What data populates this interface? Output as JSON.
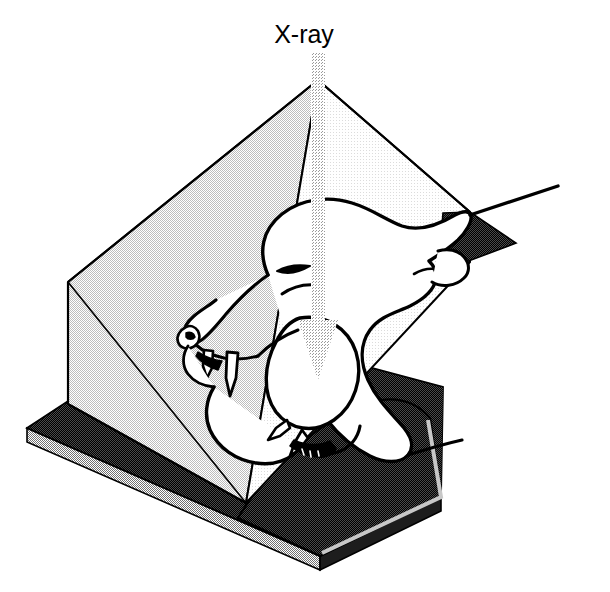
{
  "figure": {
    "domain_type": "diagram",
    "background_color": "#ffffff",
    "width": 610,
    "height": 592
  },
  "annotations": {
    "beam_label": "X-ray"
  },
  "beam": {
    "name": "x-ray-beam",
    "direction": "downward",
    "color": "#b9b9b9",
    "shaft_x": 318,
    "shaft_top_y": 52,
    "shaft_bottom_y": 325,
    "shaft_width": 14,
    "arrowhead_width": 40,
    "arrowhead_tip_y": 380
  },
  "tent": {
    "name": "triangular-prism-chamber",
    "apex": [
      318,
      80
    ],
    "left_corner": [
      68,
      282
    ],
    "front_bottom": [
      246,
      503
    ],
    "right_edge": [
      470,
      212
    ],
    "face_left_color": "#e3e3e3",
    "face_right_color": "#f4f4f4",
    "shadow_triangle_color": "#2a2a2a",
    "outline_color": "#000000"
  },
  "base": {
    "name": "specimen-base-plate",
    "top_color": "#303030",
    "edge_color": "#9a9a9a",
    "side_color": "#1a1a1a",
    "left_corner": [
      27,
      428
    ],
    "front_corner": [
      320,
      556
    ],
    "thickness": 14
  },
  "specimen": {
    "name": "animal-skull-head",
    "description": "line drawing of carnivore head with open jaws and canine teeth",
    "stroke_color": "#000000",
    "fill_color": "#ffffff",
    "body_shadow_color": "#2a2a2a",
    "parts": [
      "cranium",
      "brow",
      "eye",
      "muzzle",
      "nose",
      "upper-canine",
      "lower-canine",
      "upper-jaw",
      "lower-jaw",
      "neck",
      "ear"
    ]
  },
  "colors": {
    "ink": "#000000",
    "paper": "#ffffff",
    "light_gray": "#f4f4f4",
    "mid_gray": "#e3e3e3",
    "beam_gray": "#b9b9b9",
    "dark": "#2a2a2a",
    "base_dark": "#303030"
  }
}
